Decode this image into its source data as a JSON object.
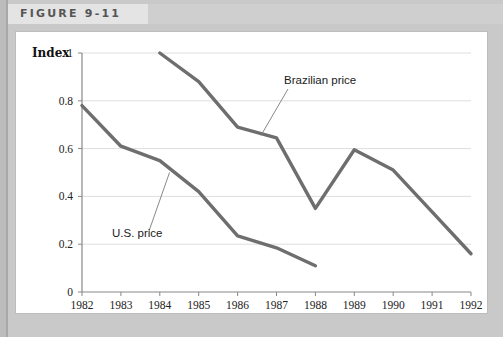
{
  "figure": {
    "banner_label": "FIGURE 9-11"
  },
  "chart_data": {
    "type": "line",
    "title": "FIGURE 9-11",
    "xlabel": "",
    "ylabel": "Index",
    "categories": [
      "1982",
      "1983",
      "1984",
      "1985",
      "1986",
      "1987",
      "1988",
      "1989",
      "1990",
      "1991",
      "1992"
    ],
    "x": [
      1982,
      1983,
      1984,
      1985,
      1986,
      1987,
      1988,
      1989,
      1990,
      1991,
      1992
    ],
    "xlim": [
      1982,
      1992
    ],
    "ylim": [
      0,
      1
    ],
    "yticks": [
      0,
      0.2,
      0.4,
      0.6,
      0.8,
      1
    ],
    "ytick_labels": [
      "0",
      "0.2",
      "0.4",
      "0.6",
      "0.8",
      "1"
    ],
    "grid": true,
    "legend_position": "inline-annotations",
    "series": [
      {
        "name": "U.S. price",
        "color": "#6e6e6e",
        "x": [
          1982,
          1983,
          1984,
          1985,
          1986,
          1987,
          1988
        ],
        "values": [
          0.78,
          0.61,
          0.55,
          0.42,
          0.235,
          0.185,
          0.11
        ]
      },
      {
        "name": "Brazilian price",
        "color": "#6e6e6e",
        "x": [
          1984,
          1985,
          1986,
          1987,
          1988,
          1989,
          1990,
          1991,
          1992
        ],
        "values": [
          1.0,
          0.88,
          0.69,
          0.645,
          0.35,
          0.595,
          0.51,
          0.335,
          0.16
        ]
      }
    ],
    "annotations": [
      {
        "text": "Brazilian price",
        "target_x": 1986.6,
        "target_y": 0.655
      },
      {
        "text": "U.S. price",
        "target_x": 1984.25,
        "target_y": 0.5
      }
    ]
  },
  "axis": {
    "index_label": "Index",
    "y_labels": [
      "1",
      "0.8",
      "0.6",
      "0.4",
      "0.2",
      "0"
    ],
    "x_labels": [
      "1982",
      "1983",
      "1984",
      "1985",
      "1986",
      "1987",
      "1988",
      "1989",
      "1990",
      "1991",
      "1992"
    ]
  },
  "annotations": {
    "brazilian": "Brazilian price",
    "us": "U.S. price"
  },
  "colors": {
    "line": "#6e6e6e",
    "grid": "#dedede",
    "banner_left": "#e4e4e4",
    "banner_right": "#cfcfcf",
    "page_bg": "#c9c9c9"
  }
}
